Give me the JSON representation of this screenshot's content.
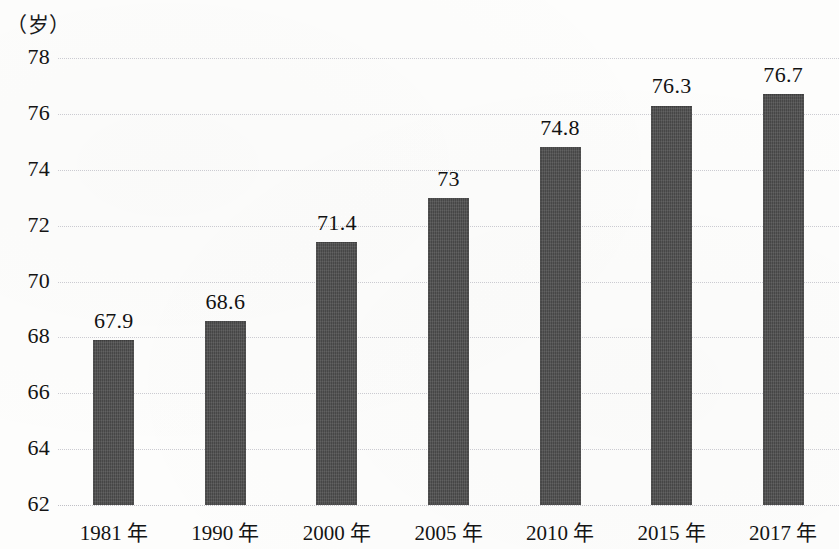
{
  "chart_data": {
    "type": "bar",
    "title": "",
    "subtitle": "",
    "xlabel": "",
    "ylabel": "（岁）",
    "unit_label": "（岁）",
    "categories": [
      "1981 年",
      "1990 年",
      "2000 年",
      "2005 年",
      "2010 年",
      "2015 年",
      "2017 年"
    ],
    "values": [
      67.9,
      68.6,
      71.4,
      73,
      74.8,
      76.3,
      76.7
    ],
    "value_labels": [
      "67.9",
      "68.6",
      "71.4",
      "73",
      "74.8",
      "76.3",
      "76.7"
    ],
    "ylim": [
      62,
      78
    ],
    "yticks": [
      62,
      64,
      66,
      68,
      70,
      72,
      74,
      76,
      78
    ],
    "ytick_labels": [
      "62",
      "64",
      "66",
      "68",
      "70",
      "72",
      "74",
      "76",
      "78"
    ],
    "grid": true,
    "grid_style": "dotted",
    "legend": null,
    "legend_position": "none",
    "bar_color": "#4d4d4d",
    "grid_color": "#c9c9cf",
    "background_color": "#fdfdfc",
    "text_color": "#141414"
  }
}
